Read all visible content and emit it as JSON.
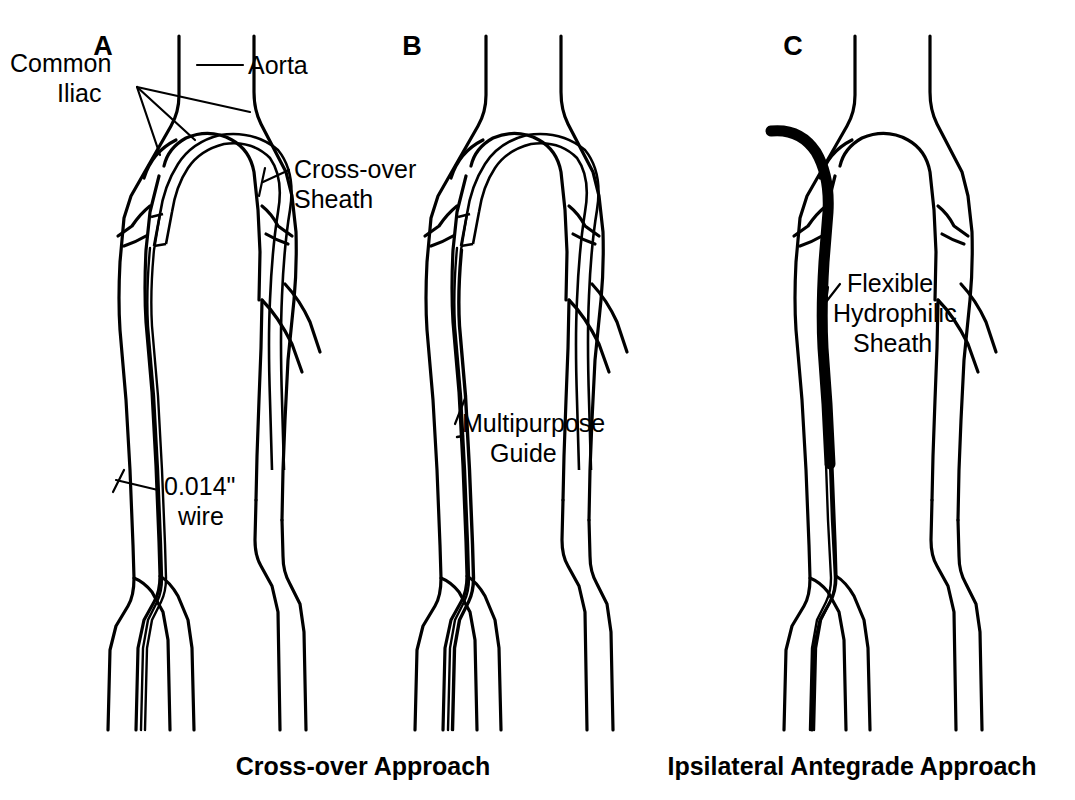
{
  "figure": {
    "background_color": "#ffffff",
    "line_color": "#000000",
    "width": 1075,
    "height": 800
  },
  "panels": [
    {
      "id": "A",
      "letter": "A",
      "letter_x": 103,
      "letter_y": 55,
      "callouts": [
        {
          "id": "common-iliac",
          "lines": [
            "Common",
            "Iliac"
          ],
          "x": 10,
          "y": 72,
          "anchor": "start"
        },
        {
          "id": "aorta",
          "lines": [
            "Aorta"
          ],
          "x": 225,
          "y": 72,
          "anchor": "start"
        },
        {
          "id": "cross-over-sheath",
          "lines": [
            "Cross-over",
            "Sheath"
          ],
          "x": 290,
          "y": 178,
          "anchor": "start"
        },
        {
          "id": "wire",
          "lines": [
            "0.014\"",
            "wire"
          ],
          "x": 160,
          "y": 498,
          "anchor": "start"
        }
      ]
    },
    {
      "id": "B",
      "letter": "B",
      "letter_x": 412,
      "letter_y": 55,
      "callouts": [
        {
          "id": "multipurpose-guide",
          "lines": [
            "Multipurpose",
            "Guide"
          ],
          "x": 458,
          "y": 432,
          "anchor": "start"
        }
      ]
    },
    {
      "id": "C",
      "letter": "C",
      "letter_x": 793,
      "letter_y": 55,
      "callouts": [
        {
          "id": "flexible-hydrophilic-sheath",
          "lines": [
            "Flexible",
            "Hydrophilic",
            "Sheath"
          ],
          "x": 843,
          "y": 292,
          "anchor": "start"
        }
      ]
    }
  ],
  "captions": [
    {
      "id": "cross-over-approach",
      "text": "Cross-over Approach",
      "x": 363,
      "y": 775
    },
    {
      "id": "ipsilateral-antegrade-approach",
      "text": "Ipsilateral Antegrade Approach",
      "x": 852,
      "y": 775
    }
  ],
  "legend_terms": {
    "common_iliac": "Common Iliac",
    "aorta": "Aorta",
    "cross_over_sheath": "Cross-over Sheath",
    "wire_size": "0.014\" wire",
    "multipurpose_guide": "Multipurpose Guide",
    "flexible_hydrophilic_sheath": "Flexible Hydrophilic Sheath"
  }
}
